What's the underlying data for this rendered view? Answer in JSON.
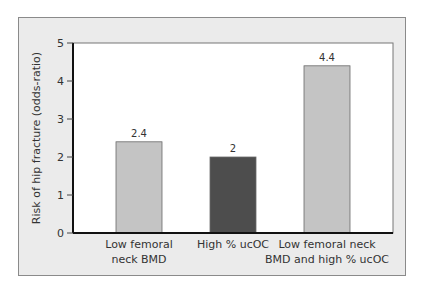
{
  "chart_data": {
    "type": "bar",
    "title": "",
    "xlabel": "",
    "ylabel": "Risk of hip fracture (odds-ratio)",
    "ylim": [
      0,
      5
    ],
    "yticks": [
      0,
      1,
      2,
      3,
      4,
      5
    ],
    "grid": false,
    "categories": [
      [
        "Low femoral",
        "neck BMD"
      ],
      [
        "High % ucOC"
      ],
      [
        "Low femoral neck",
        "BMD and high % ucOC"
      ]
    ],
    "values": [
      2.4,
      2,
      4.4
    ],
    "data_labels": [
      "2.4",
      "2",
      "4.4"
    ],
    "bar_colors": [
      "#c4c4c4",
      "#4d4d4d",
      "#c4c4c4"
    ]
  },
  "colors": {
    "panel_background": "#ebebeb",
    "plot_background": "#ffffff",
    "axis": "#111111"
  }
}
